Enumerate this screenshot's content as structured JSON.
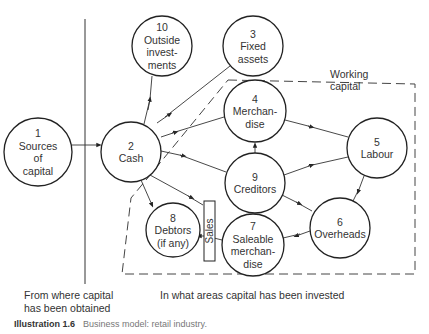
{
  "diagram": {
    "nodes": [
      {
        "id": "1",
        "lines": [
          "1",
          "Sources",
          "of",
          "capital"
        ],
        "cx": 38,
        "cy": 152,
        "r": 34
      },
      {
        "id": "2",
        "lines": [
          "2",
          "Cash"
        ],
        "cx": 131,
        "cy": 152,
        "r": 30
      },
      {
        "id": "10",
        "lines": [
          "10",
          "Outside",
          "invest-",
          "ments"
        ],
        "cx": 162,
        "cy": 46,
        "r": 30
      },
      {
        "id": "3",
        "lines": [
          "3",
          "Fixed",
          "assets"
        ],
        "cx": 253,
        "cy": 46,
        "r": 30
      },
      {
        "id": "4",
        "lines": [
          "4",
          "Merchan-",
          "dise"
        ],
        "cx": 255,
        "cy": 111,
        "r": 31
      },
      {
        "id": "5",
        "lines": [
          "5",
          "Labour"
        ],
        "cx": 377,
        "cy": 148,
        "r": 30
      },
      {
        "id": "9",
        "lines": [
          "9",
          "Creditors"
        ],
        "cx": 255,
        "cy": 183,
        "r": 30
      },
      {
        "id": "6",
        "lines": [
          "6",
          "Overheads"
        ],
        "cx": 340,
        "cy": 228,
        "r": 30
      },
      {
        "id": "7",
        "lines": [
          "7",
          "Saleable",
          "merchan-",
          "dise"
        ],
        "cx": 253,
        "cy": 245,
        "r": 31
      },
      {
        "id": "8",
        "lines": [
          "8",
          "Debtors",
          "(if any)"
        ],
        "cx": 173,
        "cy": 230,
        "r": 27
      }
    ],
    "sales_box": {
      "label": "Sales"
    },
    "working_capital_label": [
      "Working",
      "capital"
    ],
    "edges": [
      {
        "from": "1",
        "to": "2"
      },
      {
        "from": "2",
        "to": "10"
      },
      {
        "from": "2",
        "to": "3"
      },
      {
        "from": "2",
        "to": "4"
      },
      {
        "from": "2",
        "to": "9"
      },
      {
        "from": "2",
        "to": "8"
      },
      {
        "from": "2",
        "to": "Sales"
      },
      {
        "from": "4",
        "to": "5"
      },
      {
        "from": "9",
        "to": "4"
      },
      {
        "from": "9",
        "to": "5"
      },
      {
        "from": "9",
        "to": "6"
      },
      {
        "from": "5",
        "to": "6"
      },
      {
        "from": "6",
        "to": "7"
      },
      {
        "from": "7",
        "to": "Sales"
      },
      {
        "from": "Sales",
        "to": "8"
      }
    ]
  },
  "notes": {
    "left": [
      "From where capital",
      "has been obtained"
    ],
    "right": "In what areas capital has been invested"
  },
  "caption": {
    "number": "Illustration 1.6",
    "text": "Business model: retail industry."
  }
}
